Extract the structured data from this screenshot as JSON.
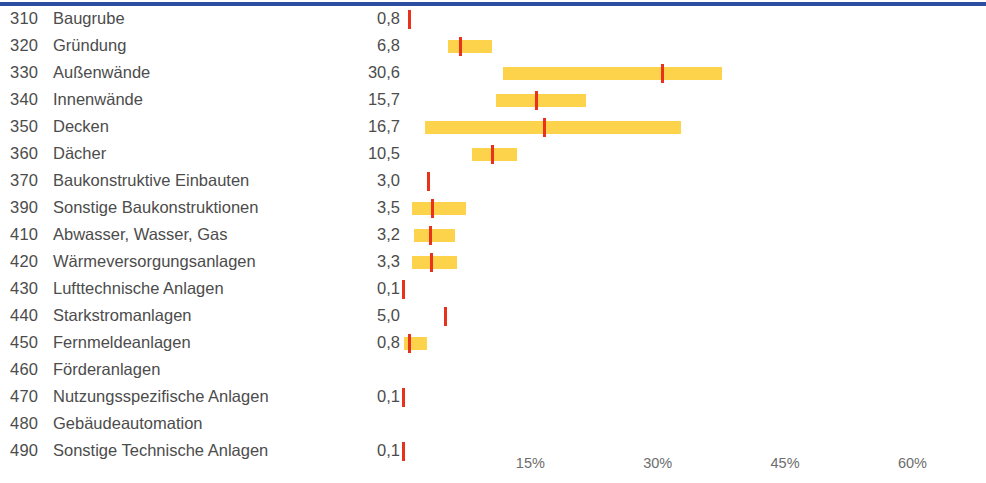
{
  "chart_data": {
    "type": "bar",
    "title": "",
    "subtitle": "",
    "xlabel": "",
    "ylabel": "",
    "xlim": [
      0,
      65
    ],
    "grid": false,
    "legend": "none",
    "value_unit": "%",
    "axis_ticks": [
      {
        "label": "15%",
        "value": 15
      },
      {
        "label": "30%",
        "value": 30
      },
      {
        "label": "45%",
        "value": 45
      },
      {
        "label": "60%",
        "value": 60
      }
    ],
    "series": [
      {
        "name": "Mittelwert",
        "color": "#e8321c",
        "type": "marker"
      },
      {
        "name": "Spannweite",
        "color": "#fcd34a",
        "type": "range"
      }
    ],
    "categories": [
      "Baugrube",
      "Gründung",
      "Außenwände",
      "Innenwände",
      "Decken",
      "Dächer",
      "Baukonstruktive Einbauten",
      "Sonstige Baukonstruktionen",
      "Abwasser, Wasser, Gas",
      "Wärmeversorgungsanlagen",
      "Lufttechnische Anlagen",
      "Starkstromanlagen",
      "Fernmeldeanlagen",
      "Förderanlagen",
      "Nutzungsspezifische Anlagen",
      "Gebäudeautomation",
      "Sonstige Technische Anlagen"
    ],
    "codes": [
      "310",
      "320",
      "330",
      "340",
      "350",
      "360",
      "370",
      "390",
      "410",
      "420",
      "430",
      "440",
      "450",
      "460",
      "470",
      "480",
      "490"
    ],
    "values": [
      0.8,
      6.8,
      30.6,
      15.7,
      16.7,
      10.5,
      3.0,
      3.5,
      3.2,
      3.3,
      0.1,
      5.0,
      0.8,
      null,
      0.1,
      null,
      0.1
    ],
    "ranges": [
      null,
      [
        5.3,
        10.5
      ],
      [
        11.8,
        37.6
      ],
      [
        11.0,
        21.5
      ],
      [
        2.6,
        32.8
      ],
      [
        8.1,
        13.4
      ],
      null,
      [
        1.1,
        7.4
      ],
      [
        1.3,
        6.1
      ],
      [
        1.1,
        6.4
      ],
      null,
      null,
      [
        0.1,
        2.8
      ],
      null,
      null,
      null,
      null
    ]
  },
  "rows": [
    {
      "code": "310",
      "label": "Baugrube",
      "value": "0,8"
    },
    {
      "code": "320",
      "label": "Gründung",
      "value": "6,8"
    },
    {
      "code": "330",
      "label": "Außenwände",
      "value": "30,6"
    },
    {
      "code": "340",
      "label": "Innenwände",
      "value": "15,7"
    },
    {
      "code": "350",
      "label": "Decken",
      "value": "16,7"
    },
    {
      "code": "360",
      "label": "Dächer",
      "value": "10,5"
    },
    {
      "code": "370",
      "label": "Baukonstruktive Einbauten",
      "value": "3,0"
    },
    {
      "code": "390",
      "label": "Sonstige Baukonstruktionen",
      "value": "3,5"
    },
    {
      "code": "410",
      "label": "Abwasser, Wasser, Gas",
      "value": "3,2"
    },
    {
      "code": "420",
      "label": "Wärmeversorgungsanlagen",
      "value": "3,3"
    },
    {
      "code": "430",
      "label": "Lufttechnische Anlagen",
      "value": "0,1"
    },
    {
      "code": "440",
      "label": "Starkstromanlagen",
      "value": "5,0"
    },
    {
      "code": "450",
      "label": "Fernmeldeanlagen",
      "value": "0,8"
    },
    {
      "code": "460",
      "label": "Förderanlagen",
      "value": ""
    },
    {
      "code": "470",
      "label": "Nutzungsspezifische Anlagen",
      "value": "0,1"
    },
    {
      "code": "480",
      "label": "Gebäudeautomation",
      "value": ""
    },
    {
      "code": "490",
      "label": "Sonstige Technische Anlagen",
      "value": "0,1"
    }
  ],
  "colors": {
    "top_rule": "#2b4ea2",
    "range_bar": "#fcd34a",
    "mean_marker": "#e8321c",
    "text": "#4c4c4c",
    "axis_text": "#6d6d6d"
  }
}
